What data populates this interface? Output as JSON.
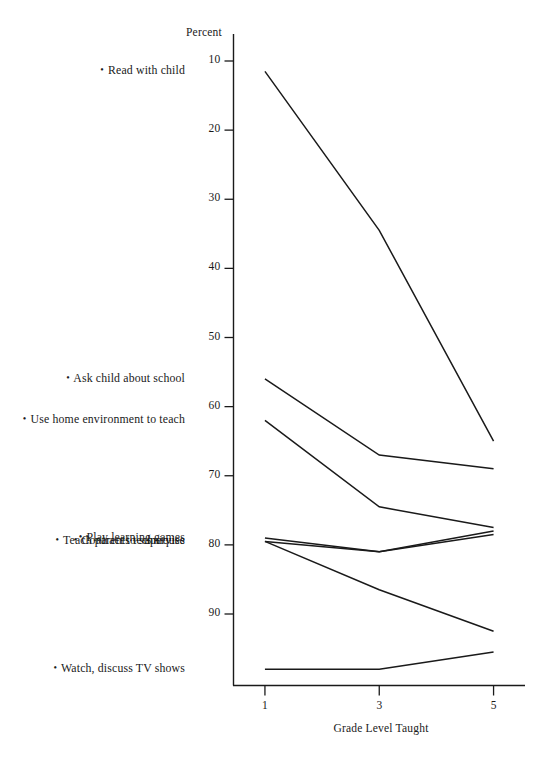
{
  "chart_data": {
    "type": "line",
    "title": "",
    "xlabel": "Grade Level Taught",
    "ylabel": "Percent",
    "x": [
      1,
      3,
      5
    ],
    "xticklabels": [
      "1",
      "3",
      "5"
    ],
    "xlim": [
      0.45,
      5.55
    ],
    "ylim": [
      0,
      92
    ],
    "yticks": [
      10,
      20,
      30,
      40,
      50,
      60,
      70,
      80,
      90
    ],
    "yticklabels": [
      "10",
      "20",
      "30",
      "40",
      "50",
      "60",
      "70",
      "80",
      "90"
    ],
    "grid": false,
    "legend_position": "left-outside-labels",
    "series": [
      {
        "name": "Read with child",
        "values": [
          88.5,
          65.5,
          35.0
        ]
      },
      {
        "name": "Ask child about school",
        "values": [
          44.0,
          33.0,
          31.0
        ]
      },
      {
        "name": "Use home environment to teach",
        "values": [
          38.0,
          25.5,
          22.5
        ]
      },
      {
        "name": "Play learning games",
        "values": [
          21.0,
          19.0,
          21.5
        ]
      },
      {
        "name": "Teach parents techniques",
        "values": [
          20.5,
          19.0,
          22.0
        ]
      },
      {
        "name": "Contract to supervise",
        "values": [
          20.5,
          13.5,
          7.5
        ]
      },
      {
        "name": "Watch, discuss TV shows",
        "values": [
          2.0,
          2.0,
          4.5
        ]
      }
    ]
  },
  "axes": {
    "y_axis_caption": "Percent",
    "x_axis_caption": "Grade Level Taught",
    "y_ticks": [
      {
        "label": "90"
      },
      {
        "label": "80"
      },
      {
        "label": "70"
      },
      {
        "label": "60"
      },
      {
        "label": "50"
      },
      {
        "label": "40"
      },
      {
        "label": "30"
      },
      {
        "label": "20"
      },
      {
        "label": "10"
      }
    ],
    "x_ticks": [
      {
        "label": "1"
      },
      {
        "label": "3"
      },
      {
        "label": "5"
      }
    ]
  },
  "series_labels": [
    {
      "bullet": "•",
      "text": "Read with child"
    },
    {
      "bullet": "•",
      "text": "Ask child about school"
    },
    {
      "bullet": "•",
      "text": "Use home environment to teach"
    },
    {
      "bullet": "•",
      "text": "Play learning games"
    },
    {
      "bullet": "•",
      "text": "Teach parents techniques"
    },
    {
      "bullet": "•",
      "text": "Contract to supervise"
    },
    {
      "bullet": "•",
      "text": "Watch, discuss TV shows"
    }
  ],
  "caption": {
    "label": "",
    "text": ""
  },
  "colors": {
    "line": "#1a1a1a",
    "axis": "#1a1a1a",
    "background": "#ffffff",
    "text": "#1a1a1a"
  }
}
